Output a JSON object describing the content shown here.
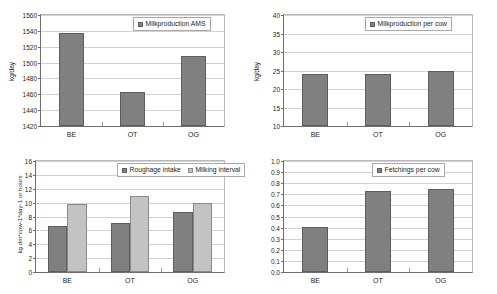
{
  "figure": {
    "background": "#ffffff",
    "series_colors": {
      "dark_gray": "#808080",
      "light_gray": "#c3c3c3"
    }
  },
  "chart_data": [
    {
      "id": "milkproduction-ams",
      "type": "bar",
      "title": "",
      "xlabel": "",
      "ylabel": "kg/day",
      "categories": [
        "BE",
        "OT",
        "OG"
      ],
      "values": [
        1537,
        1463,
        1508
      ],
      "series": [
        {
          "name": "Milkproduction AMS",
          "values": [
            1537,
            1463,
            1508
          ],
          "color": "#808080"
        }
      ],
      "legend": [
        "Milkproduction AMS"
      ],
      "legend_position": "top-right",
      "ylim": [
        1420,
        1560
      ],
      "yticks": [
        1420,
        1440,
        1460,
        1480,
        1500,
        1520,
        1540,
        1560
      ],
      "ytick_labels": [
        "1420",
        "1440",
        "1460",
        "1480",
        "1500",
        "1520",
        "1540",
        "1560"
      ],
      "grid": true
    },
    {
      "id": "milkproduction-per-cow",
      "type": "bar",
      "title": "",
      "xlabel": "",
      "ylabel": "kg/day",
      "categories": [
        "BE",
        "OT",
        "OG"
      ],
      "values": [
        24.0,
        24.1,
        24.8
      ],
      "series": [
        {
          "name": "Milkproduction per cow",
          "values": [
            24.0,
            24.1,
            24.8
          ],
          "color": "#808080"
        }
      ],
      "legend": [
        "Milkproduction per cow"
      ],
      "legend_position": "top-right",
      "ylim": [
        10,
        40
      ],
      "yticks": [
        10,
        15,
        20,
        25,
        30,
        35,
        40
      ],
      "ytick_labels": [
        "10",
        "15",
        "20",
        "25",
        "30",
        "35",
        "40"
      ],
      "grid": true
    },
    {
      "id": "roughage-milking-interval",
      "type": "bar",
      "title": "",
      "xlabel": "",
      "ylabel": "kg dm*cow-1*day-1 or hours",
      "categories": [
        "BE",
        "OT",
        "OG"
      ],
      "series": [
        {
          "name": "Roughage intake",
          "values": [
            6.7,
            7.1,
            8.7
          ],
          "color": "#808080"
        },
        {
          "name": "Milking interval",
          "values": [
            9.8,
            10.9,
            10.0
          ],
          "color": "#c3c3c3"
        }
      ],
      "legend": [
        "Roughage intake",
        "Milking interval"
      ],
      "legend_position": "top-right",
      "ylim": [
        0,
        16
      ],
      "yticks": [
        0,
        2,
        4,
        6,
        8,
        10,
        12,
        14,
        16
      ],
      "ytick_labels": [
        "0",
        "2",
        "4",
        "6",
        "8",
        "10",
        "12",
        "14",
        "16"
      ],
      "grid": true
    },
    {
      "id": "fetchings-per-cow",
      "type": "bar",
      "title": "",
      "xlabel": "",
      "ylabel": "",
      "categories": [
        "BE",
        "OT",
        "OG"
      ],
      "values": [
        0.41,
        0.73,
        0.75
      ],
      "series": [
        {
          "name": "Fetchings per cow",
          "values": [
            0.41,
            0.73,
            0.75
          ],
          "color": "#808080"
        }
      ],
      "legend": [
        "Fetchings per cow"
      ],
      "legend_position": "top-right",
      "ylim": [
        0.0,
        1.0
      ],
      "yticks": [
        0.0,
        0.1,
        0.2,
        0.3,
        0.4,
        0.5,
        0.6,
        0.7,
        0.8,
        0.9,
        1.0
      ],
      "ytick_labels": [
        "0.0",
        "0.1",
        "0.2",
        "0.3",
        "0.4",
        "0.5",
        "0.6",
        "0.7",
        "0.8",
        "0.9",
        "1.0"
      ],
      "grid": true
    }
  ]
}
